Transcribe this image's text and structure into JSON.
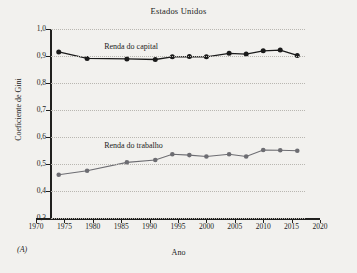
{
  "figure": {
    "title": "Estados Unidos",
    "panel_letter": "(A)",
    "xlabel": "Ano",
    "ylabel": "Coeficiente de Gini"
  },
  "axes": {
    "y_ticks": [
      "1,0",
      "0,9",
      "0,8",
      "0,7",
      "0,6",
      "0,5",
      "0,4",
      "0,3"
    ],
    "x_ticks": [
      "1970",
      "1975",
      "1980",
      "1985",
      "1990",
      "1995",
      "2000",
      "2005",
      "2010",
      "2015",
      "2020"
    ]
  },
  "labels": {
    "capital": "Renda do capital",
    "labor": "Renda do trabalho"
  },
  "colors": {
    "capital": "#1a1a1a",
    "labor": "#6d6d72",
    "axis": "#20201e",
    "grid": "#b9b7b1",
    "background": "#f2f1ee"
  },
  "chart_data": {
    "type": "line",
    "title": "Estados Unidos",
    "xlabel": "Ano",
    "ylabel": "Coeficiente de Gini",
    "xlim": [
      1970,
      2020
    ],
    "ylim": [
      0.3,
      1.0
    ],
    "ytick_step": 0.1,
    "xtick_step": 5,
    "grid": true,
    "grid_style": "dotted-horizontal",
    "legend": "inline-annotations",
    "decimal_separator": ",",
    "series": [
      {
        "name": "Renda do capital",
        "color": "#1a1a1a",
        "marker": "filled-circle",
        "x": [
          1974,
          1979,
          1986,
          1991,
          1994,
          1997,
          2000,
          2004,
          2007,
          2010,
          2013,
          2016
        ],
        "values": [
          0.915,
          0.891,
          0.889,
          0.887,
          0.897,
          0.898,
          0.897,
          0.91,
          0.907,
          0.919,
          0.922,
          0.902
        ]
      },
      {
        "name": "Renda do trabalho",
        "color": "#6d6d72",
        "marker": "filled-circle",
        "x": [
          1974,
          1979,
          1986,
          1991,
          1994,
          1997,
          2000,
          2004,
          2007,
          2010,
          2013,
          2016
        ],
        "values": [
          0.46,
          0.475,
          0.506,
          0.515,
          0.536,
          0.533,
          0.528,
          0.536,
          0.528,
          0.552,
          0.551,
          0.549
        ]
      }
    ]
  }
}
